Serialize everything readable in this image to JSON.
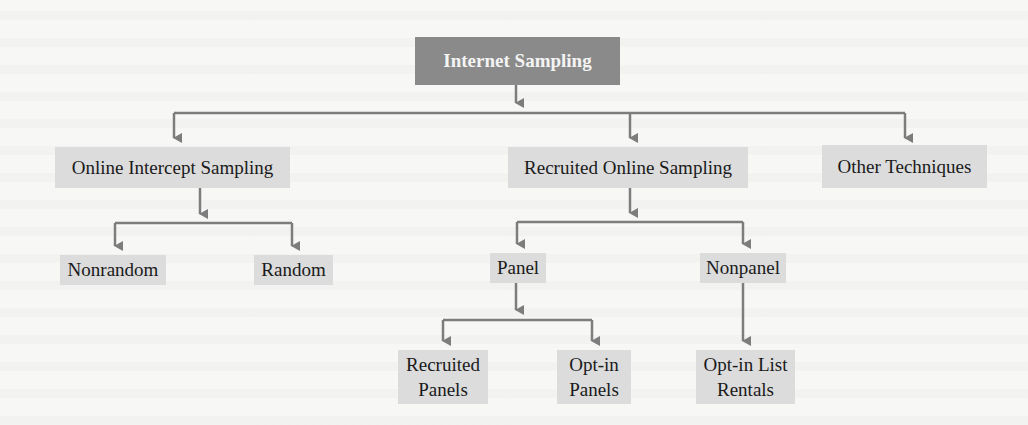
{
  "diagram": {
    "root": {
      "label": "Internet Sampling"
    },
    "level1": [
      {
        "label": "Online Intercept Sampling"
      },
      {
        "label": "Recruited Online Sampling"
      },
      {
        "label": "Other Techniques"
      }
    ],
    "intercept_children": [
      {
        "label": "Nonrandom"
      },
      {
        "label": "Random"
      }
    ],
    "recruited_children": [
      {
        "label": "Panel"
      },
      {
        "label": "Nonpanel"
      }
    ],
    "panel_children": [
      {
        "label": "Recruited Panels"
      },
      {
        "label": "Opt-in Panels"
      }
    ],
    "nonpanel_children": [
      {
        "label": "Opt-in List Rentals"
      }
    ],
    "colors": {
      "root_fill": "#8a8a8a",
      "node_fill": "#dcdcdc",
      "connector": "#7d7d7d",
      "background": "#f7f7f5"
    }
  }
}
